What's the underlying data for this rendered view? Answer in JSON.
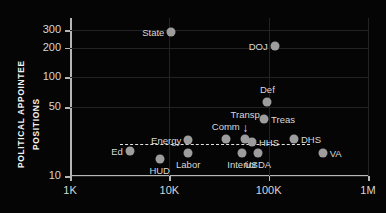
{
  "chart_data": {
    "type": "scatter",
    "title": "",
    "xlabel": "",
    "ylabel_lines": [
      "POLITICAL APPOINTEE",
      "POSITIONS"
    ],
    "xscale": "log",
    "yscale": "log",
    "xlim": [
      1000,
      1000000
    ],
    "ylim": [
      10,
      400
    ],
    "grid": true,
    "legend": "none",
    "xticks": [
      {
        "value": 1000,
        "label": "1K"
      },
      {
        "value": 10000,
        "label": "10K"
      },
      {
        "value": 100000,
        "label": "100K"
      },
      {
        "value": 1000000,
        "label": "1M"
      }
    ],
    "yticks": [
      {
        "value": 300,
        "label": "300"
      },
      {
        "value": 200,
        "label": "200"
      },
      {
        "value": 100,
        "label": "100"
      },
      {
        "value": 50,
        "label": "50"
      },
      {
        "value": 10,
        "label": "10"
      }
    ],
    "reference_line": {
      "y": 21,
      "style": "dashed",
      "x_start": 3200,
      "x_end": 260000
    },
    "annotations": [
      {
        "name": "transp-arrow",
        "glyph": "↓",
        "x": 58000,
        "y": 27
      }
    ],
    "points": [
      {
        "label": "State",
        "x": 10500,
        "y": 290,
        "label_pos": "left"
      },
      {
        "label": "DOJ",
        "x": 115000,
        "y": 210,
        "label_pos": "left"
      },
      {
        "label": "Def",
        "x": 97000,
        "y": 57,
        "label_pos": "above"
      },
      {
        "label": "Treas",
        "x": 90000,
        "y": 38,
        "label_pos": "right"
      },
      {
        "label": "Transp",
        "x": 58000,
        "y": 24,
        "label_pos": "arrow-above"
      },
      {
        "label": "Comm",
        "x": 37000,
        "y": 24,
        "label_pos": "above"
      },
      {
        "label": "HHS",
        "x": 68000,
        "y": 22,
        "label_pos": "right"
      },
      {
        "label": "DHS",
        "x": 180000,
        "y": 24,
        "label_pos": "right"
      },
      {
        "label": "Energy",
        "x": 15500,
        "y": 23,
        "label_pos": "left"
      },
      {
        "label": "Ed",
        "x": 4000,
        "y": 18,
        "label_pos": "left"
      },
      {
        "label": "HUD",
        "x": 8000,
        "y": 15,
        "label_pos": "below"
      },
      {
        "label": "Labor",
        "x": 15500,
        "y": 17,
        "label_pos": "below"
      },
      {
        "label": "Interior",
        "x": 54000,
        "y": 17,
        "label_pos": "below"
      },
      {
        "label": "USDA",
        "x": 78000,
        "y": 17,
        "label_pos": "below"
      },
      {
        "label": "VA",
        "x": 350000,
        "y": 17,
        "label_pos": "right"
      }
    ]
  }
}
